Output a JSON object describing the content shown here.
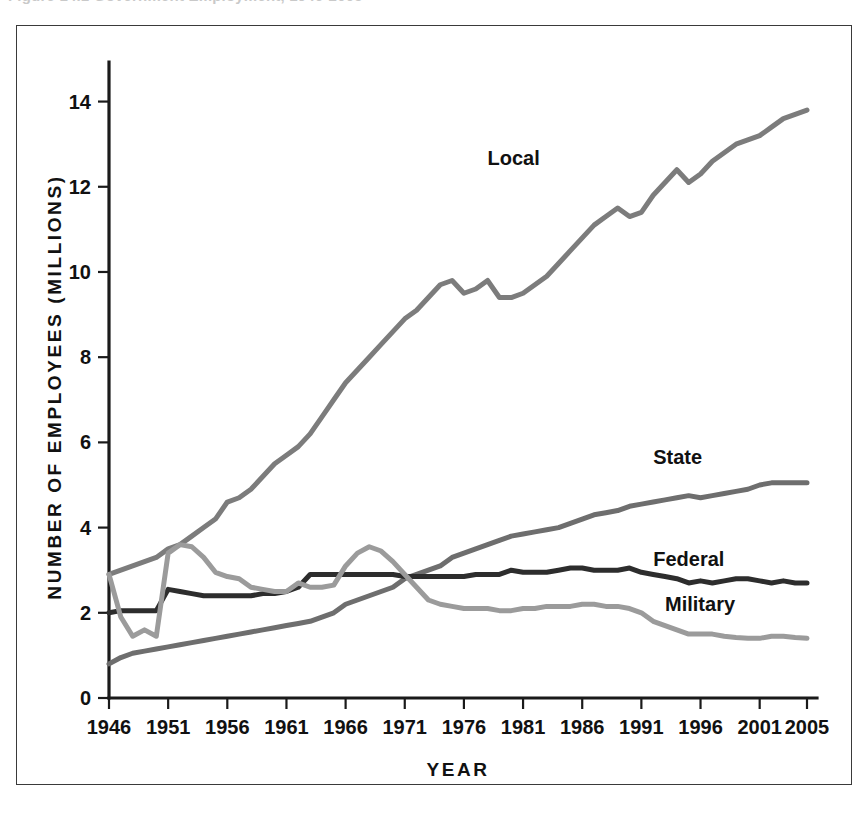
{
  "top_clipped_text": "Figure 14.1  Government Employment, 1946-2005",
  "chart_data": {
    "type": "line",
    "title": "",
    "xlabel": "YEAR",
    "ylabel": "NUMBER OF EMPLOYEES (MILLIONS)",
    "xlim": [
      1946,
      2005
    ],
    "ylim": [
      0,
      14.6
    ],
    "grid": false,
    "legend_position": "inline-right",
    "xticks": [
      1946,
      1951,
      1956,
      1961,
      1966,
      1971,
      1976,
      1981,
      1986,
      1991,
      1996,
      2001,
      2005
    ],
    "xtick_labels": [
      "1946",
      "1951",
      "1956",
      "1961",
      "1966",
      "1971",
      "1976",
      "1981",
      "1986",
      "1991",
      "1996",
      "2001",
      "2005"
    ],
    "yticks": [
      0,
      2,
      4,
      6,
      8,
      10,
      12,
      14
    ],
    "ytick_labels": [
      "0",
      "2",
      "4",
      "6",
      "8",
      "10",
      "12",
      "14"
    ],
    "x": [
      1946,
      1947,
      1948,
      1949,
      1950,
      1951,
      1952,
      1953,
      1954,
      1955,
      1956,
      1957,
      1958,
      1959,
      1960,
      1961,
      1962,
      1963,
      1964,
      1965,
      1966,
      1967,
      1968,
      1969,
      1970,
      1971,
      1972,
      1973,
      1974,
      1975,
      1976,
      1977,
      1978,
      1979,
      1980,
      1981,
      1982,
      1983,
      1984,
      1985,
      1986,
      1987,
      1988,
      1989,
      1990,
      1991,
      1992,
      1993,
      1994,
      1995,
      1996,
      1997,
      1998,
      1999,
      2000,
      2001,
      2002,
      2003,
      2004,
      2005
    ],
    "series": [
      {
        "name": "Local",
        "color": "#7c7c7c",
        "label": "Local",
        "label_x": 1978,
        "label_y": 12.5,
        "values": [
          2.9,
          3.0,
          3.1,
          3.2,
          3.3,
          3.5,
          3.6,
          3.8,
          4.0,
          4.2,
          4.6,
          4.7,
          4.9,
          5.2,
          5.5,
          5.7,
          5.9,
          6.2,
          6.6,
          7.0,
          7.4,
          7.7,
          8.0,
          8.3,
          8.6,
          8.9,
          9.1,
          9.4,
          9.7,
          9.8,
          9.5,
          9.6,
          9.8,
          9.4,
          9.4,
          9.5,
          9.7,
          9.9,
          10.2,
          10.5,
          10.8,
          11.1,
          11.3,
          11.5,
          11.3,
          11.4,
          11.8,
          12.1,
          12.4,
          12.1,
          12.3,
          12.6,
          12.8,
          13.0,
          13.1,
          13.2,
          13.4,
          13.6,
          13.7,
          13.8
        ]
      },
      {
        "name": "State",
        "color": "#6e6e6e",
        "label": "State",
        "label_x": 1992,
        "label_y": 5.5,
        "values": [
          0.8,
          0.95,
          1.05,
          1.1,
          1.15,
          1.2,
          1.25,
          1.3,
          1.35,
          1.4,
          1.45,
          1.5,
          1.55,
          1.6,
          1.65,
          1.7,
          1.75,
          1.8,
          1.9,
          2.0,
          2.2,
          2.3,
          2.4,
          2.5,
          2.6,
          2.8,
          2.9,
          3.0,
          3.1,
          3.3,
          3.4,
          3.5,
          3.6,
          3.7,
          3.8,
          3.85,
          3.9,
          3.95,
          4.0,
          4.1,
          4.2,
          4.3,
          4.35,
          4.4,
          4.5,
          4.55,
          4.6,
          4.65,
          4.7,
          4.75,
          4.7,
          4.75,
          4.8,
          4.85,
          4.9,
          5.0,
          5.05,
          5.05,
          5.05,
          5.05
        ]
      },
      {
        "name": "Federal",
        "color": "#2d2d2d",
        "label": "Federal",
        "label_x": 1992,
        "label_y": 3.1,
        "values": [
          2.0,
          2.05,
          2.05,
          2.05,
          2.05,
          2.55,
          2.5,
          2.45,
          2.4,
          2.4,
          2.4,
          2.4,
          2.4,
          2.45,
          2.45,
          2.5,
          2.6,
          2.9,
          2.9,
          2.9,
          2.9,
          2.9,
          2.9,
          2.9,
          2.9,
          2.85,
          2.85,
          2.85,
          2.85,
          2.85,
          2.85,
          2.9,
          2.9,
          2.9,
          3.0,
          2.95,
          2.95,
          2.95,
          3.0,
          3.05,
          3.05,
          3.0,
          3.0,
          3.0,
          3.05,
          2.95,
          2.9,
          2.85,
          2.8,
          2.7,
          2.75,
          2.7,
          2.75,
          2.8,
          2.8,
          2.75,
          2.7,
          2.75,
          2.7,
          2.7
        ]
      },
      {
        "name": "Military",
        "color": "#9b9b9b",
        "label": "Military",
        "label_x": 1993,
        "label_y": 2.05,
        "values": [
          2.9,
          1.9,
          1.45,
          1.6,
          1.45,
          3.4,
          3.6,
          3.55,
          3.3,
          2.95,
          2.85,
          2.8,
          2.6,
          2.55,
          2.5,
          2.5,
          2.7,
          2.6,
          2.6,
          2.65,
          3.1,
          3.4,
          3.55,
          3.45,
          3.2,
          2.9,
          2.6,
          2.3,
          2.2,
          2.15,
          2.1,
          2.1,
          2.1,
          2.05,
          2.05,
          2.1,
          2.1,
          2.15,
          2.15,
          2.15,
          2.2,
          2.2,
          2.15,
          2.15,
          2.1,
          2.0,
          1.8,
          1.7,
          1.6,
          1.5,
          1.5,
          1.5,
          1.45,
          1.42,
          1.4,
          1.4,
          1.45,
          1.45,
          1.42,
          1.4
        ]
      }
    ]
  },
  "series_labels": {
    "local": "Local",
    "state": "State",
    "federal": "Federal",
    "military": "Military"
  }
}
